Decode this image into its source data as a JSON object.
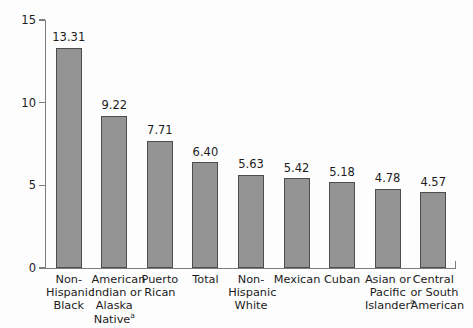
{
  "chart_data": {
    "type": "bar",
    "title": "",
    "subtitle": "",
    "xlabel": "",
    "ylabel": "Rate per 1,000 live births",
    "ylim": [
      0,
      15
    ],
    "yticks": [
      "0",
      "5",
      "10",
      "15"
    ],
    "ytick_values": [
      0,
      5,
      10,
      15
    ],
    "grid": false,
    "legend": "none",
    "bar_color": "#949494",
    "bar_edge_color": "#4d4d4d",
    "axis_color": "#7d7d7d",
    "background_color": "#fdfdfd",
    "categories": [
      "Non-Hispanic Black",
      "American Indian or Alaska Native",
      "Puerto Rican",
      "Total",
      "Non-Hispanic White",
      "Mexican",
      "Cuban",
      "Asian or Pacific Islander",
      "Central or South American"
    ],
    "category_lines": [
      [
        "Non-",
        "Hispanic",
        "Black"
      ],
      [
        "American",
        "Indian or",
        "Alaska",
        "Native"
      ],
      [
        "Puerto",
        "Rican"
      ],
      [
        "Total"
      ],
      [
        "Non-",
        "Hispanic",
        "White"
      ],
      [
        "Mexican"
      ],
      [
        "Cuban"
      ],
      [
        "Asian or",
        "Pacific",
        "Islander"
      ],
      [
        "Central",
        "or South",
        "American"
      ]
    ],
    "footnote_marker": "a",
    "categories_with_footnote": [
      1,
      7
    ],
    "values": [
      13.31,
      9.22,
      7.71,
      6.4,
      5.63,
      5.42,
      5.18,
      4.78,
      4.57
    ],
    "value_labels": [
      "13.31",
      "9.22",
      "7.71",
      "6.40",
      "5.63",
      "5.42",
      "5.18",
      "4.78",
      "4.57"
    ]
  }
}
